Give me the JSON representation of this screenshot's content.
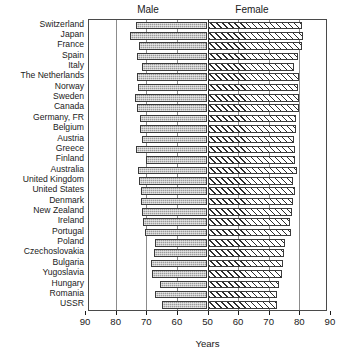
{
  "chart_data": {
    "type": "bar",
    "subtype": "bidirectional-back-to-back-bar",
    "title": "",
    "xlabel": "Years",
    "ylabel": "",
    "grid": true,
    "legend_position": "top-as-column-headers",
    "axis": {
      "left_ticks": [
        90,
        80,
        70,
        60,
        50
      ],
      "right_ticks": [
        50,
        60,
        70,
        80,
        90
      ],
      "center_value": 50,
      "left_limit": 90,
      "right_limit": 90,
      "units": "years"
    },
    "panel_headers": [
      "Male",
      "Female"
    ],
    "categories": [
      "Switzerland",
      "Japan",
      "France",
      "Spain",
      "Italy",
      "The Netherlands",
      "Norway",
      "Sweden",
      "Canada",
      "Germany, FR",
      "Belgium",
      "Austria",
      "Greece",
      "Finland",
      "Australia",
      "United Kingdom",
      "United States",
      "Denmark",
      "New Zealand",
      "Ireland",
      "Portugal",
      "Poland",
      "Czechoslovakia",
      "Bulgaria",
      "Yugoslavia",
      "Hungary",
      "Romania",
      "USSR"
    ],
    "series": [
      {
        "name": "Male",
        "direction": "left",
        "fill": "stipple-grey",
        "values": [
          73.5,
          75.3,
          72.5,
          73.0,
          71.5,
          73.0,
          72.8,
          73.8,
          73.0,
          72.2,
          72.0,
          71.5,
          73.5,
          70.2,
          72.8,
          72.4,
          71.6,
          71.8,
          71.5,
          71.0,
          70.3,
          67.2,
          67.5,
          68.5,
          68.0,
          65.5,
          67.0,
          64.8
        ]
      },
      {
        "name": "Female",
        "direction": "right",
        "fill": "diagonal-hatch",
        "values": [
          81.0,
          81.2,
          80.8,
          79.7,
          78.2,
          79.8,
          79.6,
          79.8,
          80.0,
          78.9,
          78.8,
          78.3,
          78.5,
          78.6,
          79.2,
          78.1,
          78.6,
          77.8,
          77.6,
          76.8,
          77.3,
          75.4,
          75.0,
          74.7,
          74.2,
          73.5,
          72.8,
          72.7
        ]
      }
    ]
  },
  "chart": {
    "header_male": "Male",
    "header_female": "Female",
    "xtitle": "Years",
    "left_tick_labels": [
      "90",
      "80",
      "70",
      "60",
      "50"
    ],
    "right_tick_labels": [
      "60",
      "70",
      "80",
      "90"
    ]
  },
  "colors": {
    "male_fill": "#9b9b9b",
    "female_fill": "#ffffff",
    "bar_border": "#3a3a3a",
    "axis": "#1a1a1a",
    "gridline": "#8c8c8c",
    "background": "#ffffff"
  }
}
